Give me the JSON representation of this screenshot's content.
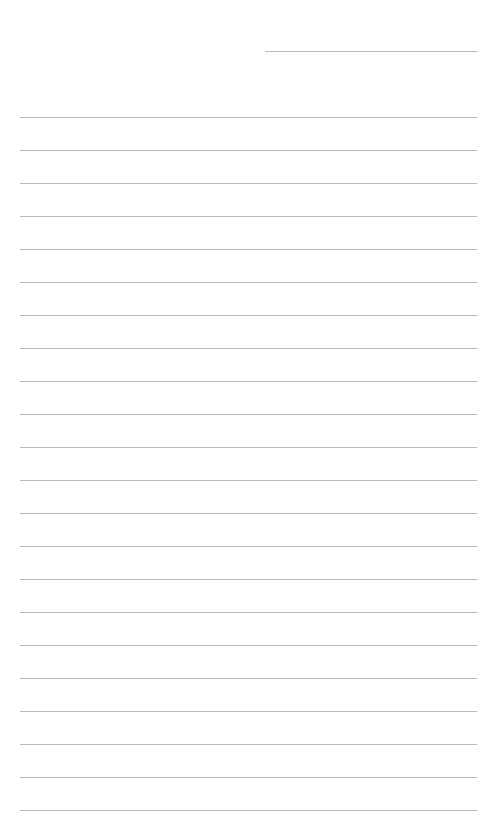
{
  "page": {
    "type": "lined-paper",
    "title_line": {
      "x": 265,
      "y": 51,
      "width": 212
    },
    "rules": {
      "count": 22,
      "start_y": 117,
      "spacing": 33.0,
      "x": 20,
      "width": 457
    },
    "line_color": "#b9b9b9"
  }
}
